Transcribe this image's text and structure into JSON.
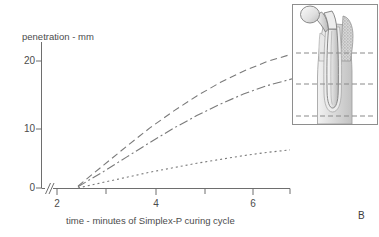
{
  "figure": {
    "panel_label": "B",
    "background_color": "#ffffff",
    "line_color": "#7a7a7a",
    "axis_color": "#6e6e6e",
    "text_color": "#4c4c4c"
  },
  "chart_data": {
    "type": "line",
    "title": "",
    "xlabel": "time - minutes of Simplex-P curing cycle",
    "ylabel": "penetration - mm",
    "xlim": [
      2,
      7.3
    ],
    "ylim": [
      0,
      23
    ],
    "x_ticks": [
      2,
      3,
      4,
      5,
      6,
      7
    ],
    "x_tick_labels": [
      "2",
      "",
      "4",
      "",
      "6",
      ""
    ],
    "y_ticks": [
      0,
      10,
      20
    ],
    "y_tick_labels": [
      "0",
      "10",
      "20"
    ],
    "grid": false,
    "legend": "none",
    "axis_break": "//",
    "axis_break_note": "x-axis broken between origin and 2 minutes",
    "series": [
      {
        "name": "proximal level",
        "dash_style": "long-dash",
        "x": [
          2.45,
          3.0,
          3.5,
          4.0,
          4.5,
          5.0,
          5.5,
          6.0,
          6.5,
          7.0
        ],
        "values": [
          0.3,
          3.6,
          6.6,
          9.5,
          12.1,
          14.5,
          16.6,
          18.4,
          19.9,
          21.0
        ]
      },
      {
        "name": "mid level",
        "dash_style": "dash-dot",
        "x": [
          2.45,
          3.0,
          3.5,
          4.0,
          4.5,
          5.0,
          5.5,
          6.0,
          6.5,
          7.05
        ],
        "values": [
          0.2,
          2.6,
          4.9,
          7.2,
          9.4,
          11.4,
          13.2,
          14.8,
          16.1,
          17.2
        ]
      },
      {
        "name": "distal level",
        "dash_style": "fine-dot",
        "x": [
          2.45,
          3.0,
          3.5,
          4.0,
          4.5,
          5.0,
          5.5,
          6.0,
          6.5,
          7.0
        ],
        "values": [
          0.0,
          0.9,
          1.7,
          2.5,
          3.2,
          3.9,
          4.5,
          5.1,
          5.6,
          6.0
        ]
      }
    ]
  },
  "y_axis": {
    "title": "penetration - mm",
    "ticks": [
      {
        "label": "20"
      },
      {
        "label": "10"
      },
      {
        "label": "0"
      }
    ]
  },
  "x_axis": {
    "title": "time - minutes of Simplex-P curing cycle",
    "ticks": [
      {
        "label": "2"
      },
      {
        "label": "4"
      },
      {
        "label": "6"
      }
    ]
  },
  "inset": {
    "caption": "",
    "description": "femoral hip stem prosthesis in bone cement mantle",
    "level_lines": [
      {
        "name": "proximal-level-line"
      },
      {
        "name": "mid-level-line"
      },
      {
        "name": "distal-level-line"
      }
    ]
  }
}
